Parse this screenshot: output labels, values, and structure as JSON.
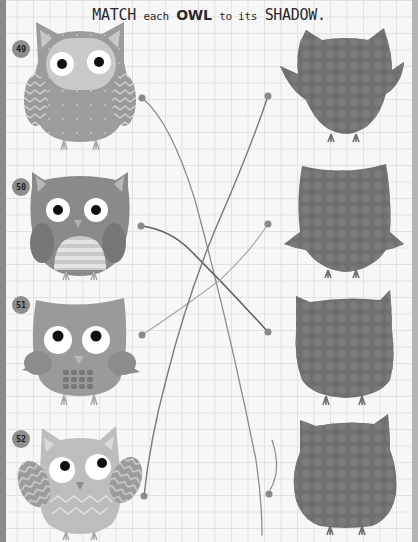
{
  "title": {
    "part1": "MATCH",
    "part2": "each",
    "part3": "OWL",
    "part4": "to its",
    "part5": "SHADOW."
  },
  "owls": [
    {
      "number": "49",
      "name": "owl-49"
    },
    {
      "number": "50",
      "name": "owl-50"
    },
    {
      "number": "51",
      "name": "owl-51"
    },
    {
      "number": "52",
      "name": "owl-52"
    }
  ],
  "shadows": [
    {
      "name": "shadow-a"
    },
    {
      "name": "shadow-b"
    },
    {
      "name": "shadow-c"
    },
    {
      "name": "shadow-d"
    }
  ],
  "colors": {
    "grid": "#e2e2e2",
    "paper": "#f7f7f7",
    "shadow": "#6f6f6f",
    "string_dark": "#6b6b6b",
    "string_light": "#9a9a9a"
  }
}
